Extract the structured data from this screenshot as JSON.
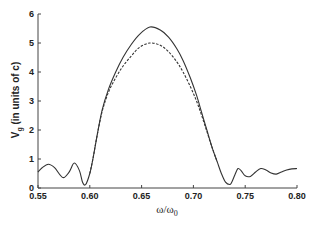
{
  "chart_data": {
    "type": "line",
    "title": "",
    "xlabel": "ω/ω0",
    "ylabel": "V_g (in units of c)",
    "xlim": [
      0.55,
      0.8
    ],
    "ylim": [
      0,
      6
    ],
    "xticks": [
      "0.55",
      "0.60",
      "0.65",
      "0.70",
      "0.75",
      "0.80"
    ],
    "yticks": [
      "0",
      "1",
      "2",
      "3",
      "4",
      "5",
      "6"
    ],
    "grid": false,
    "legend": null,
    "series": [
      {
        "name": "solid",
        "style": "solid",
        "x": [
          0.55,
          0.554,
          0.56,
          0.566,
          0.574,
          0.58,
          0.585,
          0.59,
          0.593,
          0.596,
          0.6,
          0.603,
          0.607,
          0.612,
          0.618,
          0.625,
          0.632,
          0.64,
          0.648,
          0.658,
          0.668,
          0.676,
          0.684,
          0.69,
          0.697,
          0.703,
          0.708,
          0.713,
          0.718,
          0.723,
          0.727,
          0.731,
          0.735,
          0.737,
          0.74,
          0.743,
          0.746,
          0.75,
          0.755,
          0.76,
          0.765,
          0.77,
          0.775,
          0.78,
          0.785,
          0.79,
          0.795,
          0.8
        ],
        "y": [
          0.55,
          0.7,
          0.82,
          0.7,
          0.36,
          0.55,
          0.86,
          0.6,
          0.2,
          0.12,
          0.5,
          1.0,
          1.8,
          2.7,
          3.4,
          4.0,
          4.5,
          4.95,
          5.3,
          5.55,
          5.45,
          5.2,
          4.8,
          4.4,
          3.8,
          3.2,
          2.6,
          2.0,
          1.4,
          0.9,
          0.5,
          0.2,
          0.12,
          0.2,
          0.45,
          0.67,
          0.6,
          0.42,
          0.4,
          0.55,
          0.67,
          0.62,
          0.52,
          0.48,
          0.55,
          0.62,
          0.66,
          0.67
        ]
      },
      {
        "name": "dashed",
        "style": "dashed",
        "x": [
          0.6,
          0.603,
          0.607,
          0.612,
          0.618,
          0.625,
          0.632,
          0.64,
          0.648,
          0.658,
          0.668,
          0.676,
          0.684,
          0.69,
          0.697,
          0.703,
          0.708,
          0.713,
          0.718,
          0.723
        ],
        "y": [
          0.5,
          1.0,
          1.8,
          2.65,
          3.3,
          3.8,
          4.2,
          4.55,
          4.85,
          5.0,
          4.92,
          4.7,
          4.35,
          4.0,
          3.5,
          3.0,
          2.5,
          1.95,
          1.4,
          0.9
        ]
      }
    ]
  }
}
